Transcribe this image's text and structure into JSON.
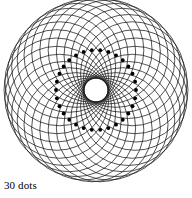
{
  "figure": {
    "name": "circle-envelope-rosette",
    "caption": "30 dots",
    "background_color": "#ffffff",
    "stroke_color": "#1a1a1a",
    "dot_color": "#000000",
    "canvas": {
      "width": 192,
      "height": 198
    }
  },
  "chart_data": {
    "type": "scatter",
    "title": "",
    "subtitle": "",
    "xlabel": "",
    "ylabel": "",
    "annotations": [
      "30 dots"
    ],
    "legend_position": "none",
    "grid": false,
    "dot_count": 30,
    "circle_count": 30,
    "center": {
      "x": 96,
      "y": 90
    },
    "dot_ring_radius": 40,
    "circle_radius": 52,
    "dot_radius": 1.9,
    "stroke_width": 0.75,
    "angle_step_degrees": 12,
    "start_angle_degrees": -96,
    "xlim": [
      4,
      188
    ],
    "ylim": [
      2,
      178
    ]
  }
}
